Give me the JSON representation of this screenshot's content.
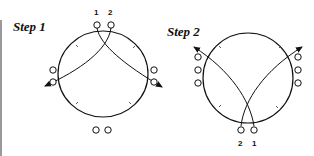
{
  "steps": [
    {
      "title": "Step 1",
      "ring_labels": [
        "1",
        "2"
      ],
      "label_position": "top"
    },
    {
      "title": "Step 2",
      "ring_labels": [
        "2",
        "1"
      ],
      "label_position": "bottom"
    }
  ],
  "colors": {
    "line": "#111111",
    "margin_rule": "#9a9a9a",
    "background": "#ffffff"
  }
}
